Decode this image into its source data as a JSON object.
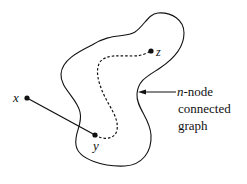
{
  "diagram": {
    "region_label": {
      "line1_italic": "n",
      "line1_rest": "-node",
      "line2": "connected",
      "line3": "graph"
    },
    "nodes": [
      {
        "id": "x",
        "label": "x",
        "cx": 27,
        "cy": 98
      },
      {
        "id": "y",
        "label": "y",
        "cx": 95,
        "cy": 135
      },
      {
        "id": "z",
        "label": "z",
        "cx": 151,
        "cy": 51
      }
    ],
    "edges": [
      {
        "from": "x",
        "to": "y",
        "style": "solid"
      },
      {
        "from": "y",
        "to": "z",
        "style": "dashed",
        "meaning": "path within graph"
      }
    ],
    "colors": {
      "stroke": "#111111",
      "background": "#ffffff"
    }
  }
}
